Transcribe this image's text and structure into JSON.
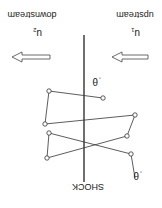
{
  "diagram": {
    "orientation": "rotated 180 degrees",
    "shock_label": "SHOCK",
    "upstream": {
      "label": "upstream",
      "velocity_symbol": "u",
      "velocity_subscript": "1"
    },
    "downstream": {
      "label": "downstream",
      "velocity_symbol": "u",
      "velocity_subscript": "2"
    },
    "angle_symbol": "θ",
    "path_vertices": 8,
    "colors": {
      "line": "#222222",
      "arrow_fill": "#ffffff",
      "vertex_fill": "#ffffff"
    }
  }
}
